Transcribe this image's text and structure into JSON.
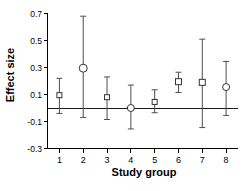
{
  "chart_data": {
    "type": "scatter",
    "title": "",
    "xlabel": "Study group",
    "ylabel": "Effect size",
    "categories": [
      "1",
      "2",
      "3",
      "4",
      "5",
      "6",
      "7",
      "8"
    ],
    "values": [
      0.095,
      0.295,
      0.08,
      0.0,
      0.045,
      0.195,
      0.19,
      0.155
    ],
    "error_low": [
      -0.04,
      -0.07,
      -0.085,
      -0.155,
      -0.035,
      0.115,
      -0.145,
      -0.055
    ],
    "error_high": [
      0.22,
      0.68,
      0.23,
      0.17,
      0.135,
      0.265,
      0.51,
      0.345
    ],
    "marker_shapes": [
      "square",
      "circle",
      "square",
      "circle",
      "square",
      "square",
      "square",
      "circle"
    ],
    "marker_sizes": [
      5,
      8,
      5,
      7,
      5,
      6,
      6,
      7
    ],
    "ylim": [
      -0.3,
      0.7
    ],
    "yticks": [
      0.7,
      0.5,
      0.3,
      0.1,
      -0.1,
      -0.3
    ],
    "ytick_labels": [
      "0.7",
      "0.5",
      "0.3",
      "0.1",
      "-0.1",
      "-0.3"
    ],
    "xlim": [
      0.5,
      8.5
    ],
    "reference_line": 0.0,
    "grid": false,
    "legend": "none",
    "colors": {
      "axis": "#000000",
      "marker_stroke": "#333333",
      "marker_fill": "#ffffff",
      "error_bar": "#4d4d4d",
      "reference_line": "#1a1a1a",
      "background": "#ffffff"
    }
  },
  "axes": {
    "y_title": "Effect size",
    "x_title": "Study group"
  }
}
